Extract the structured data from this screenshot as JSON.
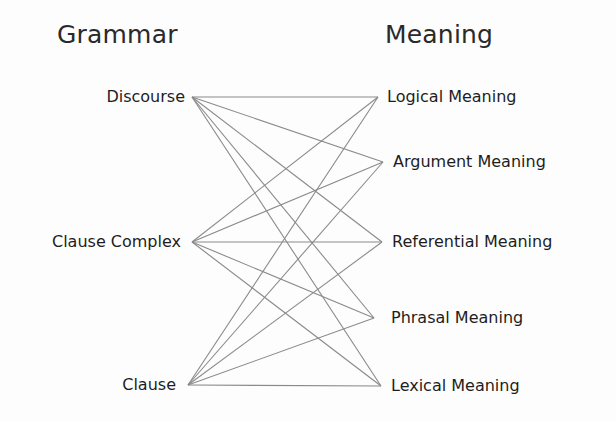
{
  "diagram": {
    "headings": {
      "left": "Grammar",
      "right": "Meaning"
    },
    "grammar_nodes": [
      {
        "id": "discourse",
        "label": "Discourse",
        "anchor": [
          192,
          97
        ]
      },
      {
        "id": "clause_complex",
        "label": "Clause Complex",
        "anchor": [
          192,
          242
        ]
      },
      {
        "id": "clause",
        "label": "Clause",
        "anchor": [
          188,
          385
        ]
      }
    ],
    "meaning_nodes": [
      {
        "id": "logical",
        "label": "Logical Meaning",
        "anchor": [
          378,
          97
        ]
      },
      {
        "id": "argument",
        "label": "Argument Meaning",
        "anchor": [
          383,
          162
        ]
      },
      {
        "id": "referential",
        "label": "Referential Meaning",
        "anchor": [
          382,
          242
        ]
      },
      {
        "id": "phrasal",
        "label": "Phrasal Meaning",
        "anchor": [
          374,
          318
        ]
      },
      {
        "id": "lexical",
        "label": "Lexical Meaning",
        "anchor": [
          381,
          386
        ]
      }
    ],
    "connections": "every grammar node connects to every meaning node",
    "line_color": "#8a8a8a"
  }
}
